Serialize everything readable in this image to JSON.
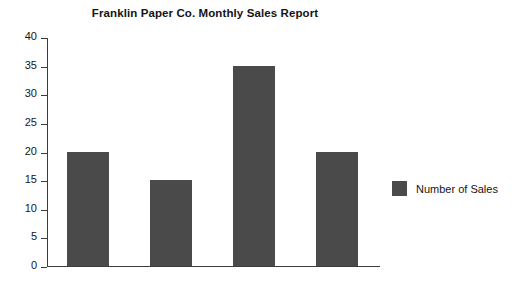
{
  "chart_data": {
    "type": "bar",
    "title": "Franklin Paper Co. Monthly Sales Report",
    "xlabel": "",
    "ylabel": "",
    "categories": [
      "J. Howard",
      "S. Jones",
      "A. Martin",
      "P. Oliveri"
    ],
    "values": [
      20,
      15,
      35,
      20
    ],
    "series": [
      {
        "name": "Number of Sales",
        "values": [
          20,
          15,
          35,
          20
        ],
        "color": "#4a4a4a"
      }
    ],
    "ylim": [
      0,
      40
    ],
    "yticks": [
      0,
      5,
      10,
      15,
      20,
      25,
      30,
      35,
      40
    ],
    "ytick_labels": [
      "0",
      "5",
      "10",
      "15",
      "20",
      "25",
      "30",
      "35",
      "40"
    ],
    "grid": false,
    "legend": {
      "position": "right",
      "entries": [
        {
          "label": "Number of Sales",
          "color": "#4a4a4a"
        }
      ]
    },
    "colors": {
      "bar": "#4a4a4a",
      "axis": "#3c3c3c",
      "text": "#161616",
      "background": "#ffffff"
    }
  }
}
